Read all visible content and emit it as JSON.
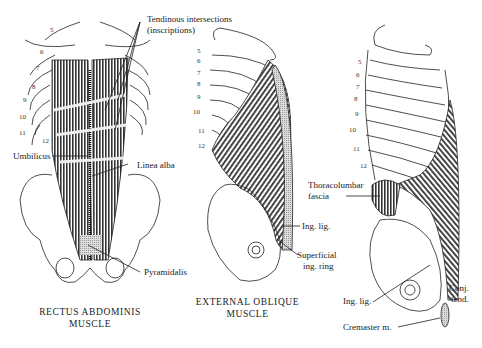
{
  "figures": [
    {
      "id": "rectus",
      "caption_line1": "RECTUS ABDOMINIS",
      "caption_line2": "MUSCLE",
      "rib_numbers": [
        "5",
        "6",
        "7",
        "8",
        "9",
        "10",
        "11",
        "12"
      ],
      "labels": {
        "tendinous_1": "Tendinous intersections",
        "tendinous_2": "(inscriptions)",
        "umbilicus": "Umbilicus",
        "linea_alba": "Linea alba",
        "pyramidalis": "Pyramidalis"
      }
    },
    {
      "id": "external_oblique",
      "caption_line1": "EXTERNAL OBLIQUE",
      "caption_line2": "MUSCLE",
      "rib_numbers": [
        "5",
        "6",
        "7",
        "8",
        "9",
        "10",
        "11",
        "12"
      ],
      "labels": {
        "ing_lig": "Ing. lig.",
        "superficial_1": "Superficial",
        "superficial_2": "ing. ring"
      }
    },
    {
      "id": "internal_oblique",
      "rib_numbers": [
        "5",
        "6",
        "7",
        "8",
        "9",
        "10",
        "11",
        "12"
      ],
      "labels": {
        "thoracolumbar_1": "Thoracolumbar",
        "thoracolumbar_2": "fascia",
        "ing_lig": "Ing. lig.",
        "conj_1": "Conj.",
        "conj_2": "tend.",
        "cremaster": "Cremaster m."
      }
    }
  ]
}
